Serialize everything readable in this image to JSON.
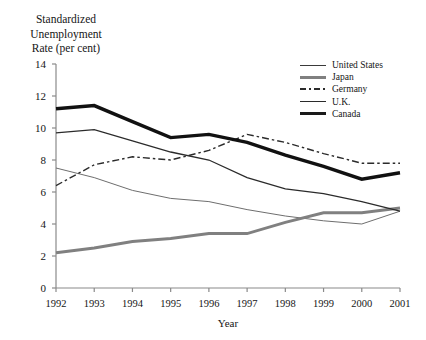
{
  "chart_data": {
    "type": "line",
    "title": "Standardized Unemployment Rate (per cent)",
    "title_lines": [
      "Standardized",
      "Unemployment",
      "Rate (per cent)"
    ],
    "xlabel": "Year",
    "ylabel": "Standardized Unemployment Rate (per cent)",
    "x": [
      1992,
      1993,
      1994,
      1995,
      1996,
      1997,
      1998,
      1999,
      2000,
      2001
    ],
    "categories": [
      "1992",
      "1993",
      "1994",
      "1995",
      "1996",
      "1997",
      "1998",
      "1999",
      "2000",
      "2001"
    ],
    "ylim": [
      0,
      14
    ],
    "yticks": [
      0,
      2,
      4,
      6,
      8,
      10,
      12,
      14
    ],
    "ytick_labels": [
      "0",
      "2",
      "4",
      "6",
      "8",
      "10",
      "12",
      "14"
    ],
    "xlim": [
      1992,
      2001
    ],
    "grid": false,
    "legend_position": "top-right",
    "series": [
      {
        "name": "United States",
        "style": "thin-solid",
        "color": "#6e6e6e",
        "width": 1.0,
        "values": [
          7.5,
          6.9,
          6.1,
          5.6,
          5.4,
          4.9,
          4.5,
          4.2,
          4.0,
          4.8
        ]
      },
      {
        "name": "Japan",
        "style": "thick-grey-solid",
        "color": "#808080",
        "width": 3.0,
        "values": [
          2.2,
          2.5,
          2.9,
          3.1,
          3.4,
          3.4,
          4.1,
          4.7,
          4.7,
          5.0
        ]
      },
      {
        "name": "Germany",
        "style": "dash-dot",
        "color": "#2b2b2b",
        "width": 1.4,
        "values": [
          6.4,
          7.7,
          8.2,
          8.0,
          8.6,
          9.6,
          9.1,
          8.4,
          7.8,
          7.8
        ]
      },
      {
        "name": "U.K.",
        "style": "medium-solid",
        "color": "#2b2b2b",
        "width": 1.3,
        "values": [
          9.7,
          9.9,
          9.2,
          8.5,
          8.0,
          6.9,
          6.2,
          5.9,
          5.4,
          4.8
        ]
      },
      {
        "name": "Canada",
        "style": "thick-black-solid",
        "color": "#111111",
        "width": 3.4,
        "values": [
          11.2,
          11.4,
          10.4,
          9.4,
          9.6,
          9.1,
          8.3,
          7.6,
          6.8,
          7.2
        ]
      }
    ],
    "legend_entries": [
      "United States",
      "Japan",
      "Germany",
      "U.K.",
      "Canada"
    ]
  }
}
